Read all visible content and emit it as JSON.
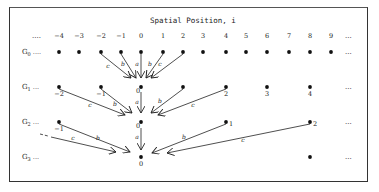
{
  "title": "Spatial Position, i",
  "header_leader": "....",
  "header_trailer": "...",
  "positions": [
    -4,
    -3,
    -2,
    -1,
    0,
    1,
    2,
    3,
    4,
    5,
    6,
    7,
    8,
    9
  ],
  "position_x": [
    59,
    79,
    101,
    121,
    141,
    163,
    183,
    203,
    226,
    246,
    267,
    289,
    310,
    331
  ],
  "rows": [
    {
      "label": "G",
      "sub": "0",
      "leader": "....",
      "y": 52,
      "nodes": [
        {
          "x": 59,
          "label": ""
        },
        {
          "x": 79,
          "label": ""
        },
        {
          "x": 101,
          "label": ""
        },
        {
          "x": 121,
          "label": ""
        },
        {
          "x": 141,
          "label": ""
        },
        {
          "x": 163,
          "label": ""
        },
        {
          "x": 183,
          "label": ""
        },
        {
          "x": 203,
          "label": ""
        },
        {
          "x": 226,
          "label": ""
        },
        {
          "x": 246,
          "label": ""
        },
        {
          "x": 267,
          "label": ""
        },
        {
          "x": 289,
          "label": ""
        },
        {
          "x": 310,
          "label": ""
        },
        {
          "x": 331,
          "label": ""
        }
      ],
      "trailer": "..."
    },
    {
      "label": "G",
      "sub": "1",
      "leader": "...",
      "y": 87,
      "nodes": [
        {
          "x": 59,
          "label": "-2"
        },
        {
          "x": 101,
          "label": "-1"
        },
        {
          "x": 141,
          "label": "0"
        },
        {
          "x": 183,
          "label": ""
        },
        {
          "x": 226,
          "label": "2"
        },
        {
          "x": 267,
          "label": "3"
        },
        {
          "x": 310,
          "label": "4"
        }
      ],
      "trailer": "..."
    },
    {
      "label": "G",
      "sub": "2",
      "leader": "...",
      "y": 122,
      "nodes": [
        {
          "x": 59,
          "label": "-1"
        },
        {
          "x": 141,
          "label": "0"
        },
        {
          "x": 226,
          "label": "1"
        },
        {
          "x": 310,
          "label": "2"
        }
      ],
      "trailer": "..."
    },
    {
      "label": "G",
      "sub": "3",
      "leader": "...",
      "y": 157,
      "nodes": [
        {
          "x": 141,
          "label": "0"
        },
        {
          "x": 310,
          "label": ""
        }
      ],
      "trailer": "..."
    }
  ],
  "arrows": [
    {
      "from": [
        101,
        52
      ],
      "to": [
        131,
        78
      ],
      "label": "c",
      "lx": 108,
      "ly": 68
    },
    {
      "from": [
        121,
        52
      ],
      "to": [
        136,
        78
      ],
      "label": "b",
      "lx": 123,
      "ly": 66
    },
    {
      "from": [
        141,
        52
      ],
      "to": [
        141,
        78
      ],
      "label": "a",
      "lx": 137,
      "ly": 66
    },
    {
      "from": [
        163,
        52
      ],
      "to": [
        146,
        78
      ],
      "label": "b",
      "lx": 150,
      "ly": 66
    },
    {
      "from": [
        183,
        52
      ],
      "to": [
        151,
        78
      ],
      "label": "c",
      "lx": 160,
      "ly": 66
    },
    {
      "from": [
        59,
        87
      ],
      "to": [
        125,
        115
      ],
      "label": "c",
      "lx": 90,
      "ly": 107
    },
    {
      "from": [
        101,
        87
      ],
      "to": [
        132,
        113
      ],
      "label": "b",
      "lx": 115,
      "ly": 106
    },
    {
      "from": [
        141,
        90
      ],
      "to": [
        141,
        113
      ],
      "label": "a",
      "lx": 137,
      "ly": 104
    },
    {
      "from": [
        183,
        87
      ],
      "to": [
        151,
        113
      ],
      "label": "b",
      "lx": 160,
      "ly": 103
    },
    {
      "from": [
        226,
        87
      ],
      "to": [
        158,
        115
      ],
      "label": "c",
      "lx": 193,
      "ly": 107
    },
    {
      "from": [
        59,
        122
      ],
      "to": [
        130,
        152
      ],
      "label": "b",
      "lx": 98,
      "ly": 140
    },
    {
      "from": [
        40,
        134
      ],
      "to": [
        116,
        152
      ],
      "label": "c",
      "lx": 73,
      "ly": 140
    },
    {
      "from": [
        141,
        126
      ],
      "to": [
        141,
        150
      ],
      "label": "a",
      "lx": 137,
      "ly": 139
    },
    {
      "from": [
        226,
        122
      ],
      "to": [
        152,
        153
      ],
      "label": "b",
      "lx": 184,
      "ly": 139
    },
    {
      "from": [
        310,
        122
      ],
      "to": [
        167,
        153
      ],
      "label": "c",
      "lx": 243,
      "ly": 142
    }
  ]
}
